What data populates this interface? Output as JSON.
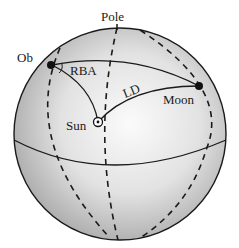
{
  "diagram": {
    "type": "celestial-sphere",
    "labels": {
      "pole": "Pole",
      "observer": "Ob",
      "rba": "RBA",
      "ld": "LD",
      "moon": "Moon",
      "sun": "Sun"
    },
    "colors": {
      "sphere_light": "#f4f4f4",
      "sphere_dark": "#a9a9a9",
      "stroke": "#1a1a1a"
    }
  }
}
